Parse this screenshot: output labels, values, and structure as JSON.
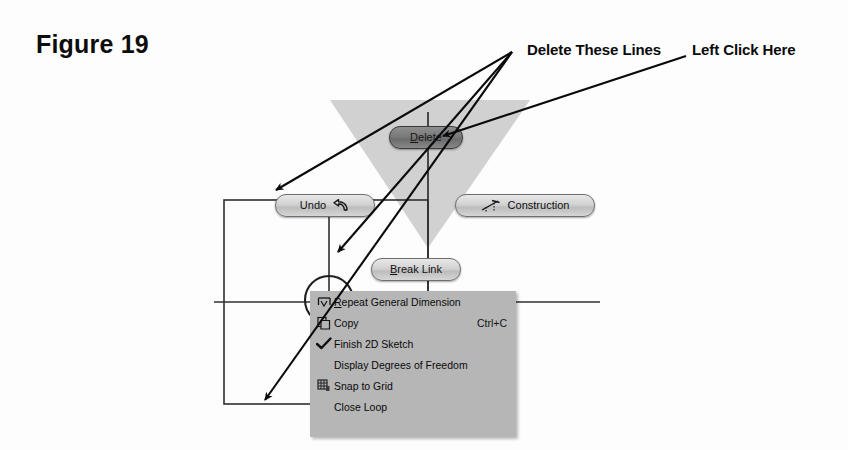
{
  "figure": {
    "caption": "Figure 19"
  },
  "annotations": [
    {
      "id": "delete-lines",
      "label": "Delete These Lines"
    },
    {
      "id": "left-click",
      "label": "Left Click Here"
    }
  ],
  "marking_menu": {
    "items": [
      {
        "id": "delete",
        "label": "Delete",
        "underline_index": 0,
        "highlighted": true,
        "icon": null
      },
      {
        "id": "undo",
        "label": "Undo",
        "underline_index": -1,
        "highlighted": false,
        "icon": "undo-arrow-icon"
      },
      {
        "id": "construction",
        "label": "Construction",
        "underline_index": -1,
        "highlighted": false,
        "icon": "construction-line-icon"
      },
      {
        "id": "break-link",
        "label": "Break Link",
        "underline_index": 0,
        "highlighted": false,
        "icon": null
      }
    ]
  },
  "context_menu": {
    "items": [
      {
        "id": "repeat-general-dimension",
        "label": "Repeat General Dimension",
        "underline_index": 0,
        "accel": "",
        "icon": "dimension-icon"
      },
      {
        "id": "copy",
        "label": "Copy",
        "underline_index": -1,
        "accel": "Ctrl+C",
        "icon": "copy-icon"
      },
      {
        "id": "finish-2d-sketch",
        "label": "Finish 2D Sketch",
        "underline_index": -1,
        "accel": "",
        "icon": "checkmark-icon"
      },
      {
        "id": "display-degrees-of-freedom",
        "label": "Display Degrees of Freedom",
        "underline_index": -1,
        "accel": "",
        "icon": null
      },
      {
        "id": "snap-to-grid",
        "label": "Snap to Grid",
        "underline_index": -1,
        "accel": "",
        "icon": "grid-icon"
      },
      {
        "id": "close-loop",
        "label": "Close Loop",
        "underline_index": -1,
        "accel": "",
        "icon": null
      }
    ]
  },
  "colors": {
    "page_background": "#fdfdfd",
    "ink": "#0a0a0a",
    "menu_background": "#b6b6b6",
    "button_face": "#d2d2d2",
    "button_highlight": "#7a7a7a",
    "wedge_gray": "#c9c9c9",
    "sketch_line": "#2a2a2a"
  },
  "sketch": {
    "description": "2D sketch geometry behind the marking menu",
    "rectangle": {
      "x": 224,
      "y": 200,
      "width": 204,
      "height": 204
    },
    "circle": {
      "cx": 329,
      "cy": 300,
      "r": 24
    },
    "horizontal_centerline": {
      "x1": 214,
      "y1": 302,
      "x2": 600,
      "y2": 302
    },
    "vertical_centerline": {
      "x1": 428,
      "y1": 112,
      "x2": 428,
      "y2": 404
    },
    "vertical_line_left": {
      "x1": 329,
      "y1": 205,
      "x2": 329,
      "y2": 330
    }
  }
}
